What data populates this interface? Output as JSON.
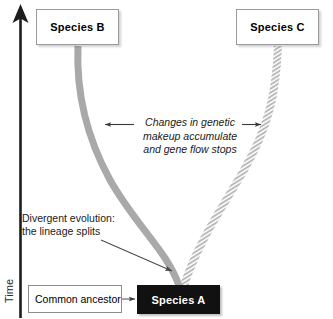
{
  "figure": {
    "type": "diagram",
    "axis": {
      "name": "time-axis",
      "label": "Time",
      "direction": "upward",
      "arrowhead": "up"
    },
    "nodes": [
      {
        "id": "species-b",
        "label": "Species B",
        "style": "white-box-bold",
        "x": 36,
        "y": 9,
        "w": 83,
        "h": 36
      },
      {
        "id": "species-c",
        "label": "Species C",
        "style": "white-box-bold",
        "x": 236,
        "y": 9,
        "w": 83,
        "h": 36
      },
      {
        "id": "species-a",
        "label": "Species A",
        "style": "black-box-bold",
        "x": 137,
        "y": 285,
        "w": 83,
        "h": 29
      },
      {
        "id": "common-ancestor",
        "label": "Common ancestor",
        "style": "white-box-plain",
        "x": 28,
        "y": 285,
        "w": 94,
        "h": 28
      }
    ],
    "lineages": [
      {
        "id": "lineage-b",
        "from": "species-a",
        "to": "species-b",
        "stroke": "solid",
        "color": "#a9a9a9",
        "width": 7
      },
      {
        "id": "lineage-c",
        "from": "species-a",
        "to": "species-c",
        "stroke": "hatched",
        "color": "#b5b5b5",
        "width": 7
      }
    ],
    "annotations": [
      {
        "id": "divergent-evolution",
        "text": "Divergent evolution:\nthe lineage splits",
        "style": "plain",
        "pointer": "arrow-to-split-point"
      },
      {
        "id": "genetic-changes",
        "text": "Changes in genetic\nmakeup accumulate\nand gene flow stops",
        "style": "italic",
        "pointer": "double-arrow-left-and-right"
      }
    ],
    "connectors": [
      {
        "id": "ancestor-to-species-a",
        "from": "common-ancestor",
        "to": "species-a",
        "arrowhead": "right"
      }
    ],
    "colors": {
      "background": "#ffffff",
      "lineage_gray": "#a9a9a9",
      "hatch_gray": "#b5b5b5",
      "node_black": "#111111",
      "box_border": "#9a9a9a",
      "text": "#1a1a1a",
      "axis": "#1d1d1d"
    }
  }
}
